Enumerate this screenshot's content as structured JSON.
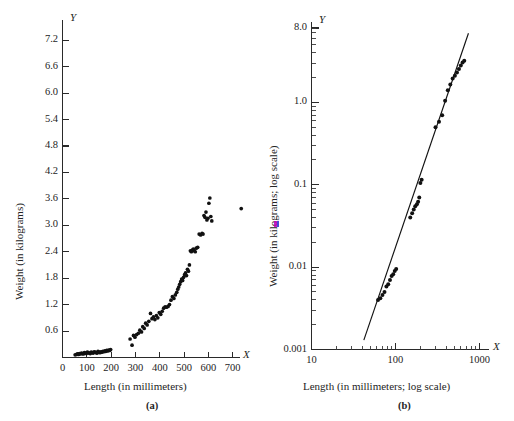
{
  "figure": {
    "panels": [
      {
        "id": "a",
        "caption": "(a)",
        "x_axis_name": "X",
        "y_axis_name": "Y",
        "xlabel": "Length (in millimeters)",
        "ylabel": "Weight (in kilograms)",
        "xticks": [
          "0",
          "100",
          "200",
          "300",
          "400",
          "500",
          "600",
          "700"
        ],
        "yticks": [
          "0.6",
          "1.2",
          "1.8",
          "2.4",
          "3.0",
          "3.6",
          "4.2",
          "4.8",
          "5.4",
          "6.0",
          "6.6",
          "7.2"
        ]
      },
      {
        "id": "b",
        "caption": "(b)",
        "x_axis_name": "X",
        "y_axis_name": "Y",
        "xlabel": "Length (in millimeters; log scale)",
        "ylabel": "Weight (in kilograms; log scale)",
        "xticks": [
          "10",
          "100",
          "1000"
        ],
        "yticks": [
          "0.001",
          "0.01",
          "0.1",
          "1.0",
          "8.0"
        ]
      }
    ]
  },
  "chart_data": [
    {
      "type": "scatter",
      "panel": "a",
      "title": "",
      "xlabel": "Length (in millimeters)",
      "ylabel": "Weight (in kilograms)",
      "xlim": [
        0,
        730
      ],
      "ylim": [
        0,
        7.5
      ],
      "xticks": [
        0,
        100,
        200,
        300,
        400,
        500,
        600,
        700
      ],
      "yticks": [
        0.6,
        1.2,
        1.8,
        2.4,
        3.0,
        3.6,
        4.2,
        4.8,
        5.4,
        6.0,
        6.6,
        7.2
      ],
      "grid": false,
      "legend": "none",
      "x": [
        52,
        58,
        62,
        66,
        70,
        74,
        78,
        82,
        86,
        90,
        94,
        98,
        102,
        106,
        110,
        114,
        118,
        122,
        126,
        130,
        134,
        138,
        142,
        146,
        150,
        154,
        158,
        162,
        166,
        170,
        174,
        178,
        182,
        186,
        190,
        194,
        198,
        278,
        286,
        292,
        298,
        305,
        312,
        318,
        325,
        330,
        336,
        342,
        348,
        355,
        362,
        368,
        374,
        380,
        386,
        392,
        398,
        404,
        410,
        416,
        422,
        428,
        434,
        440,
        446,
        452,
        458,
        464,
        470,
        474,
        478,
        482,
        486,
        490,
        494,
        498,
        502,
        506,
        510,
        514,
        518,
        522,
        526,
        530,
        534,
        538,
        542,
        546,
        550,
        556,
        562,
        568,
        574,
        578,
        582,
        586,
        590,
        594,
        598,
        602,
        606,
        610,
        614,
        735
      ],
      "y": [
        0.06,
        0.07,
        0.08,
        0.07,
        0.09,
        0.08,
        0.1,
        0.09,
        0.08,
        0.11,
        0.1,
        0.09,
        0.12,
        0.11,
        0.1,
        0.09,
        0.12,
        0.11,
        0.1,
        0.13,
        0.12,
        0.11,
        0.1,
        0.14,
        0.12,
        0.11,
        0.13,
        0.12,
        0.14,
        0.13,
        0.15,
        0.14,
        0.16,
        0.15,
        0.17,
        0.16,
        0.18,
        0.42,
        0.28,
        0.5,
        0.46,
        0.52,
        0.55,
        0.62,
        0.58,
        0.7,
        0.66,
        0.78,
        0.74,
        0.82,
        1.0,
        0.88,
        0.92,
        0.86,
        0.95,
        0.9,
        1.02,
        0.98,
        1.05,
        1.12,
        1.15,
        1.14,
        1.16,
        1.2,
        1.3,
        1.38,
        1.34,
        1.42,
        1.48,
        1.55,
        1.6,
        1.66,
        1.72,
        1.78,
        1.75,
        1.82,
        1.88,
        1.92,
        1.86,
        2.0,
        1.96,
        2.1,
        2.42,
        2.4,
        2.44,
        2.46,
        2.42,
        2.4,
        2.48,
        2.5,
        2.8,
        2.78,
        2.82,
        2.8,
        3.22,
        3.18,
        3.3,
        3.12,
        3.16,
        3.5,
        3.62,
        3.2,
        3.1,
        3.38,
        5.55,
        5.28,
        4.95,
        4.7,
        4.62,
        4.45,
        4.4,
        4.38,
        4.22,
        4.2,
        4.0,
        3.85,
        3.72,
        7.1
      ],
      "notes": "Curved, accelerating (power-law) relationship; dense low-weight cluster for lengths 50-200 mm; one extreme outlier near (735, 7.1)."
    },
    {
      "type": "scatter",
      "panel": "b",
      "title": "",
      "xlabel": "Length (in millimeters; log scale)",
      "ylabel": "Weight (in kilograms; log scale)",
      "xscale": "log",
      "yscale": "log",
      "xlim": [
        10,
        1300
      ],
      "ylim": [
        0.001,
        8.0
      ],
      "xticks": [
        10,
        100,
        1000
      ],
      "yticks": [
        0.001,
        0.01,
        0.1,
        1.0,
        8.0
      ],
      "grid": false,
      "legend": "none",
      "fit_line": {
        "x": [
          42,
          740
        ],
        "y": [
          0.0013,
          6.9
        ],
        "description": "straight regression line through log-log points"
      },
      "x": [
        62,
        66,
        70,
        74,
        78,
        82,
        86,
        90,
        94,
        98,
        102,
        150,
        158,
        165,
        172,
        180,
        186,
        192,
        198,
        205,
        300,
        330,
        360,
        390,
        420,
        450,
        480,
        510,
        540,
        570,
        600,
        630,
        660
      ],
      "y": [
        0.004,
        0.0042,
        0.0046,
        0.005,
        0.0058,
        0.0062,
        0.007,
        0.0078,
        0.0082,
        0.009,
        0.0095,
        0.04,
        0.045,
        0.05,
        0.055,
        0.058,
        0.062,
        0.07,
        0.105,
        0.115,
        0.5,
        0.58,
        0.7,
        1.05,
        1.4,
        1.65,
        1.95,
        2.1,
        2.3,
        2.55,
        2.8,
        3.05,
        3.2
      ],
      "notes": "Log-log transform linearizes the relationship; points fall tightly along the fitted straight line."
    }
  ]
}
